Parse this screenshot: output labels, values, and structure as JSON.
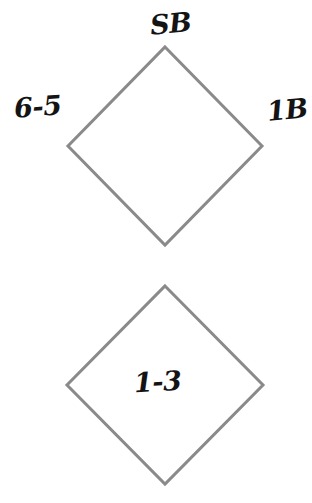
{
  "canvas": {
    "width": 312,
    "height": 503,
    "background_color": "#ffffff"
  },
  "diagram": {
    "type": "diamond-shape-diagram",
    "stroke_color": "#8a8a8a",
    "stroke_width": 3,
    "fill_color": "#ffffff",
    "text_color": "#141414",
    "shapes": [
      {
        "name": "top-diamond",
        "center_x": 165,
        "center_y": 146,
        "half_width": 97,
        "half_height": 99,
        "inner_label": ""
      },
      {
        "name": "bottom-diamond",
        "center_x": 165,
        "center_y": 385,
        "half_width": 98,
        "half_height": 99,
        "inner_label": "1-3"
      }
    ]
  },
  "labels": {
    "top": "SB",
    "left": "6-5",
    "right": "1B",
    "inner_bottom": "1-3"
  }
}
